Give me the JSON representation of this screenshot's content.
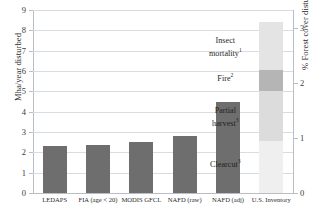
{
  "chart_data": {
    "type": "bar",
    "title": "",
    "xlabel": "",
    "ylabel": "Mha/year disturbed",
    "y2label": "% Forest cover disturbed",
    "ylim": [
      0,
      9
    ],
    "y2lim": [
      0,
      3.32
    ],
    "grid": true,
    "legend": "none",
    "yticks": [
      "0",
      "1",
      "2",
      "3",
      "4",
      "5",
      "6",
      "7",
      "8",
      "9"
    ],
    "y2ticks": [
      "0",
      "1",
      "2",
      "3"
    ],
    "categories": [
      "LEDAPS",
      "FIA (age < 20)",
      "MODIS GFCL",
      "NAFD (raw)",
      "NAFD (adj)",
      "U.S. Inventory"
    ],
    "values": [
      2.3,
      2.35,
      2.5,
      2.8,
      4.5,
      8.4
    ],
    "stacked_bar": {
      "category": "U.S. Inventory",
      "total": 8.4,
      "segments": [
        {
          "label": "Clearcut",
          "sup": "3",
          "value": 2.55,
          "color": "#efefef"
        },
        {
          "label": "Partial harvest",
          "sup": "3",
          "value": 2.45,
          "color": "#dcdcdc"
        },
        {
          "label": "Fire",
          "sup": "2",
          "value": 1.05,
          "color": "#b5b5b5"
        },
        {
          "label": "Insect mortality",
          "sup": "1",
          "value": 2.35,
          "color": "#e4e4e4"
        }
      ]
    },
    "bar_color": "#6e6e6e",
    "grid_color": "#d8dde2",
    "axis_color": "#b9bec4"
  }
}
